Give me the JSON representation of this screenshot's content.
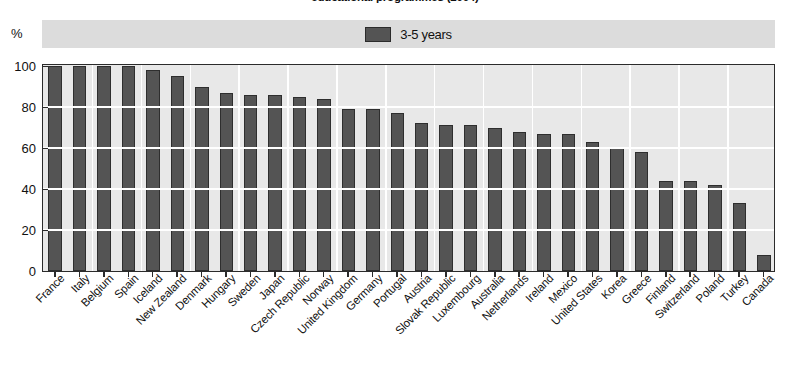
{
  "chart_data": {
    "type": "bar",
    "title": "educational programmes (2004)",
    "xlabel": "",
    "ylabel": "%",
    "ylim": [
      0,
      100
    ],
    "yticks": [
      0,
      20,
      40,
      60,
      80,
      100
    ],
    "grid": true,
    "legend_position": "top-center",
    "legend": [
      "3-5 years"
    ],
    "series": [
      {
        "name": "3-5 years",
        "color": "#545454",
        "values": [
          100,
          100,
          100,
          100,
          98,
          95,
          90,
          87,
          86,
          86,
          85,
          84,
          79,
          79,
          77,
          72,
          71,
          71,
          70,
          68,
          67,
          67,
          63,
          60,
          58,
          44,
          44,
          42,
          33,
          8
        ]
      }
    ],
    "categories": [
      "France",
      "Italy",
      "Belgium",
      "Spain",
      "Iceland",
      "New Zealand",
      "Denmark",
      "Hungary",
      "Sweden",
      "Japan",
      "Czech Republic",
      "Norway",
      "United Kingdom",
      "Germany",
      "Portugal",
      "Austria",
      "Slovak Republic",
      "Luxembourg",
      "Australia",
      "Netherlands",
      "Ireland",
      "Mexico",
      "United States",
      "Korea",
      "Greece",
      "Finland",
      "Switzerland",
      "Poland",
      "Turkey",
      "Canada"
    ]
  },
  "legend": {
    "items": [
      {
        "label": "3-5 years",
        "color": "#545454"
      }
    ]
  },
  "axis": {
    "unit_label": "%",
    "y_ticks": [
      "100",
      "80",
      "60",
      "40",
      "20",
      "0"
    ]
  }
}
